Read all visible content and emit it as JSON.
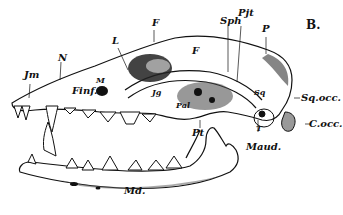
{
  "figure": {
    "panel_label": "B.",
    "labels": [
      {
        "id": "Jm",
        "text": "Jm"
      },
      {
        "id": "N",
        "text": "N"
      },
      {
        "id": "L",
        "text": "L"
      },
      {
        "id": "F_top",
        "text": "F"
      },
      {
        "id": "F_inner",
        "text": "F"
      },
      {
        "id": "M",
        "text": "M"
      },
      {
        "id": "Finf",
        "text": "Finf."
      },
      {
        "id": "Jg",
        "text": "Jg"
      },
      {
        "id": "Pal",
        "text": "Pal"
      },
      {
        "id": "Pt",
        "text": "Pt"
      },
      {
        "id": "Sph",
        "text": "Sph"
      },
      {
        "id": "Pjt",
        "text": "Pjt"
      },
      {
        "id": "P",
        "text": "P"
      },
      {
        "id": "Sq",
        "text": "Sq"
      },
      {
        "id": "T",
        "text": "T"
      },
      {
        "id": "Sqocc",
        "text": "Sq.occ."
      },
      {
        "id": "Cocc",
        "text": "C.occ."
      },
      {
        "id": "Maud",
        "text": "Maud."
      },
      {
        "id": "Md",
        "text": "Md."
      }
    ]
  },
  "colors": {
    "ink": "#111111",
    "paper": "#ffffff",
    "shade": "#555555"
  }
}
